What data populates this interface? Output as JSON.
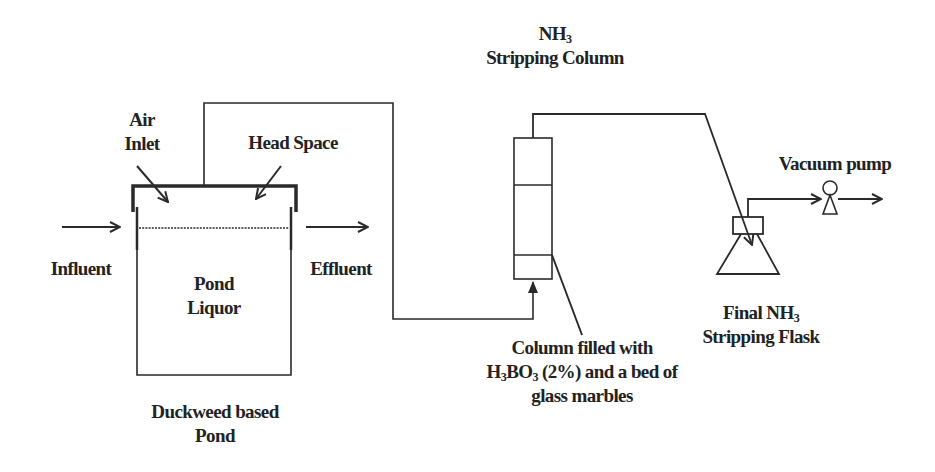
{
  "diagram": {
    "type": "process-flow-schematic",
    "line_color": "#2a2a2a",
    "text_color": "#222222",
    "background": "#ffffff",
    "labels": {
      "air_inlet": [
        "Air",
        "Inlet"
      ],
      "head_space": "Head Space",
      "influent": "Influent",
      "effluent": "Effluent",
      "pond_liquor": [
        "Pond",
        "Liquor"
      ],
      "pond_caption": [
        "Duckweed based",
        "Pond"
      ],
      "nh3_column_title": {
        "line1_base": "NH",
        "line1_sub": "3",
        "line2": "Stripping Column"
      },
      "column_fill": {
        "line1": "Column filled with",
        "line2_h": "H",
        "line2_sub1": "3",
        "line2_bo": "BO",
        "line2_sub2": "3",
        "line2_rest": " (2%) and a bed of",
        "line3": "glass marbles"
      },
      "vacuum_pump": "Vacuum pump",
      "final_flask": {
        "line1_base": "Final NH",
        "line1_sub": "3",
        "line2": "Stripping Flask"
      }
    },
    "components": [
      {
        "id": "duckweed-pond",
        "name": "Duckweed based Pond",
        "contains": [
          "Pond Liquor",
          "Head Space"
        ]
      },
      {
        "id": "stripping-column",
        "name": "NH3 Stripping Column",
        "sections": 3,
        "fill": "H3BO3 (2%) and a bed of glass marbles"
      },
      {
        "id": "final-flask",
        "name": "Final NH3 Stripping Flask"
      },
      {
        "id": "vacuum-pump",
        "name": "Vacuum pump"
      }
    ],
    "flows": [
      {
        "from": "Influent",
        "to": "duckweed-pond"
      },
      {
        "from": "duckweed-pond",
        "to": "Effluent"
      },
      {
        "from": "duckweed-pond head space",
        "to": "stripping-column bottom"
      },
      {
        "from": "stripping-column top",
        "to": "final-flask"
      },
      {
        "from": "final-flask",
        "to": "vacuum-pump"
      },
      {
        "from": "vacuum-pump",
        "to": "exhaust"
      }
    ]
  }
}
